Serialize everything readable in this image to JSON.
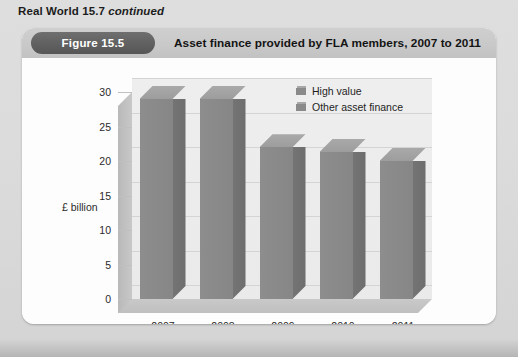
{
  "page": {
    "caption_bold": "Real World 15.7",
    "caption_italic": "continued"
  },
  "figure": {
    "badge": "Figure 15.5",
    "title": "Asset finance provided by FLA members, 2007 to 2011"
  },
  "chart_data": {
    "type": "bar",
    "title": "Asset finance provided by FLA members, 2007 to 2011",
    "xlabel": "",
    "ylabel": "£ billion",
    "categories": [
      "2007",
      "2008",
      "2009",
      "2010",
      "2011"
    ],
    "values": [
      29,
      29,
      22,
      21.3,
      20
    ],
    "ylim": [
      0,
      30
    ],
    "yticks": [
      "0",
      "5",
      "10",
      "15",
      "20",
      "25",
      "30"
    ],
    "ytick_values": [
      0,
      5,
      10,
      15,
      20,
      25,
      30
    ],
    "grid": true,
    "three_d": true,
    "legend_position": "inside-top-right",
    "legend": [
      "High value",
      "Other asset finance"
    ],
    "series": [
      {
        "name": "High value",
        "values": [
          29,
          29,
          22,
          21.3,
          20
        ]
      }
    ],
    "colors": {
      "bar_face": "#8a8a8a",
      "bar_side": "#707070",
      "bar_top": "#a2a2a2",
      "wall": "#ebebeb",
      "floor": "#c4c4c4",
      "gridline": "#d4d4d4",
      "panel": "#fdfdfd",
      "header": "#c9c9c9",
      "badge": "#606060",
      "page": "#d9d9d9"
    }
  }
}
